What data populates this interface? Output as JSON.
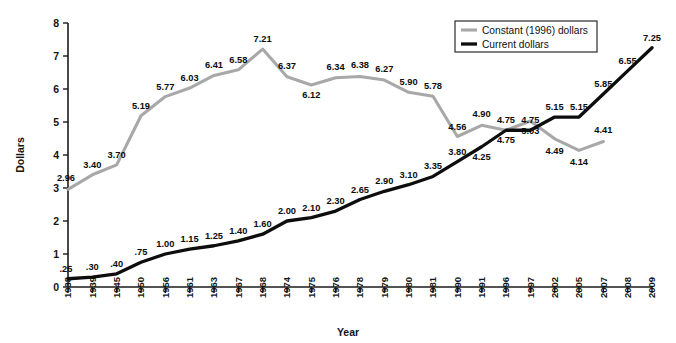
{
  "chart_data": {
    "type": "line",
    "title": "",
    "xlabel": "Year",
    "ylabel": "Dollars",
    "ylim": [
      0,
      8
    ],
    "yticks": [
      "0",
      "1",
      "2",
      "3",
      "4",
      "5",
      "6",
      "7",
      "8"
    ],
    "grid": false,
    "legend_position": "top-right",
    "categories": [
      "1938",
      "1939",
      "1945",
      "1950",
      "1956",
      "1961",
      "1963",
      "1967",
      "1968",
      "1974",
      "1975",
      "1976",
      "1978",
      "1979",
      "1980",
      "1981",
      "1990",
      "1991",
      "1996",
      "1997",
      "2002",
      "2005",
      "2007",
      "2008",
      "2009"
    ],
    "series": [
      {
        "name": "Constant (1996) dollars",
        "color": "#a8a8a8",
        "values": [
          2.96,
          3.4,
          3.7,
          5.19,
          5.77,
          6.03,
          6.41,
          6.58,
          7.21,
          6.37,
          6.12,
          6.34,
          6.38,
          6.27,
          5.9,
          5.78,
          4.56,
          4.9,
          4.75,
          5.03,
          4.49,
          4.14,
          4.41,
          null,
          null
        ],
        "labels": [
          "2.96",
          "3.40",
          "3.70",
          "5.19",
          "5.77",
          "6.03",
          "6.41",
          "6.58",
          "7.21",
          "6.37",
          "6.12",
          "6.34",
          "6.38",
          "6.27",
          "5.90",
          "5.78",
          "4.56",
          "4.90",
          "4.75",
          "5.03",
          "4.49",
          "4.14",
          "4.41",
          "",
          ""
        ]
      },
      {
        "name": "Current dollars",
        "color": "#0d0d0d",
        "values": [
          0.25,
          0.3,
          0.4,
          0.75,
          1.0,
          1.15,
          1.25,
          1.4,
          1.6,
          2.0,
          2.1,
          2.3,
          2.65,
          2.9,
          3.1,
          3.35,
          3.8,
          4.25,
          4.75,
          4.75,
          5.15,
          5.15,
          5.85,
          6.55,
          7.25
        ],
        "labels": [
          ".25",
          ".30",
          ".40",
          ".75",
          "1.00",
          "1.15",
          "1.25",
          "1.40",
          "1.60",
          "2.00",
          "2.10",
          "2.30",
          "2.65",
          "2.90",
          "3.10",
          "3.35",
          "3.80",
          "4.25",
          "4.75",
          "4.75",
          "5.15",
          "5.15",
          "5.85",
          "6.55",
          "7.25"
        ]
      }
    ]
  },
  "legend": {
    "items": [
      {
        "label": "Constant (1996) dollars",
        "color": "#a8a8a8"
      },
      {
        "label": "Current dollars",
        "color": "#0d0d0d"
      }
    ]
  },
  "axes": {
    "y_title": "Dollars",
    "x_title": "Year"
  }
}
